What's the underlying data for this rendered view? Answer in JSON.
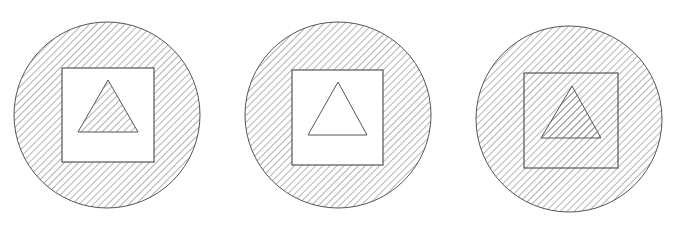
{
  "figure": {
    "panels": [
      {
        "id": "panel-1",
        "circle": {
          "cx": 107,
          "cy": 115,
          "r": 93,
          "fill": "hatched"
        },
        "square": {
          "x": 62,
          "y": 68,
          "w": 92,
          "h": 94,
          "fill": "white"
        },
        "triangle": {
          "points": "108,80 78,132 138,132",
          "fill": "hatched"
        }
      },
      {
        "id": "panel-2",
        "circle": {
          "cx": 338,
          "cy": 115,
          "r": 93,
          "fill": "hatched"
        },
        "square": {
          "x": 292,
          "y": 70,
          "w": 91,
          "h": 95,
          "fill": "white"
        },
        "triangle": {
          "points": "338,82 308,135 367,135",
          "fill": "white"
        }
      },
      {
        "id": "panel-3",
        "circle": {
          "cx": 569,
          "cy": 119,
          "r": 93,
          "fill": "hatched"
        },
        "square": {
          "x": 524,
          "y": 73,
          "w": 94,
          "h": 95,
          "fill": "hatched"
        },
        "triangle": {
          "points": "572,86 541,138 601,138",
          "fill": "hatched"
        }
      }
    ],
    "colors": {
      "stroke": "#555555",
      "hatch": "#6a6a6a",
      "background": "#ffffff"
    }
  }
}
